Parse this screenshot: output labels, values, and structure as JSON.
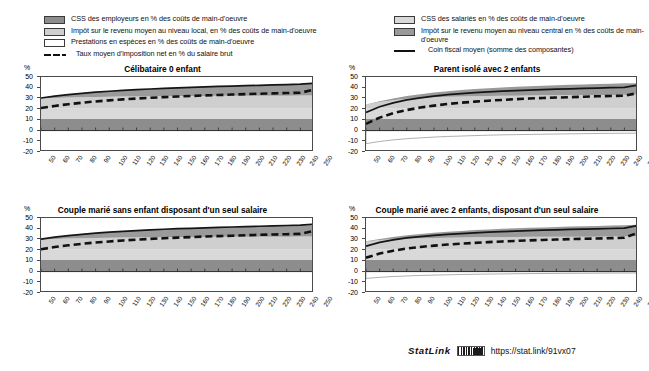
{
  "figure": {
    "units_label": "%",
    "legend_left": [
      {
        "key": "css-employeurs",
        "type": "swatch",
        "color": "#8d8d8d",
        "label": "CSS des employeurs en % des coûts de main-d'oeuvre"
      },
      {
        "key": "impot-local",
        "type": "swatch",
        "color": "#cfcfcf",
        "label": "Impôt sur le revenu moyen au niveau local, en % des coûts de main-d'oeuvre"
      },
      {
        "key": "prestations-especes",
        "type": "swatch",
        "color": "#ffffff",
        "label": "Prestations en espèces en % des coûts de main-d'oeuvre"
      },
      {
        "key": "taux-moyen-imposition-net",
        "type": "dashed",
        "color": "#111111",
        "label": "Taux moyen d'imposition net en % du salaire brut"
      }
    ],
    "legend_right": [
      {
        "key": "css-salaries",
        "type": "swatch",
        "color": "#d9d9d9",
        "label": "CSS des salariés en % des coûts de main-d'oeuvre"
      },
      {
        "key": "impot-central",
        "type": "swatch",
        "color": "#9a9a9a",
        "label": "Impôt sur le revenu moyen au niveau central en %  des coûts de main-d'oeuvre"
      },
      {
        "key": "coin-fiscal-moyen",
        "type": "solid",
        "color": "#111111",
        "label": "Coin fiscal moyen (somme des composantes)"
      }
    ],
    "statlink": {
      "word": "StatLink",
      "icon": "qr-barcode-icon",
      "url": "https://stat.link/91vx07"
    }
  },
  "chart_data": [
    {
      "id": "celibataire-0-enfant",
      "type": "area",
      "title": "Célibataire 0 enfant",
      "xlabel": "",
      "ylabel": "%",
      "ylim": [
        -20,
        50
      ],
      "yticks": [
        50,
        40,
        30,
        20,
        10,
        0,
        -10,
        -20
      ],
      "xlim": [
        50,
        250
      ],
      "x": [
        50,
        60,
        70,
        80,
        90,
        100,
        110,
        120,
        130,
        140,
        150,
        160,
        170,
        180,
        190,
        200,
        210,
        220,
        230,
        240,
        250
      ],
      "grid": false,
      "legend": "shared-top",
      "series": [
        {
          "name": "CSS des employeurs en % des coûts de main-d'oeuvre",
          "values": [
            10.8,
            10.8,
            10.8,
            10.8,
            10.8,
            10.8,
            10.8,
            10.8,
            10.8,
            10.8,
            10.8,
            10.8,
            10.8,
            10.8,
            10.8,
            10.8,
            10.8,
            10.8,
            10.8,
            10.8,
            10.8
          ]
        },
        {
          "name": "CSS des salariés en % des coûts de main-d'oeuvre",
          "values": [
            9.8,
            9.8,
            9.8,
            9.8,
            9.8,
            9.8,
            9.8,
            9.8,
            9.8,
            9.8,
            9.8,
            9.8,
            9.8,
            9.8,
            9.8,
            9.8,
            9.8,
            9.8,
            9.8,
            9.8,
            9.8
          ]
        },
        {
          "name": "Impôt sur le revenu moyen au niveau local, en % des coûts de main-d'oeuvre",
          "values": [
            9.3,
            9.9,
            10.3,
            10.6,
            10.8,
            11.0,
            11.2,
            11.3,
            11.4,
            11.5,
            11.6,
            11.6,
            11.7,
            11.8,
            11.8,
            11.9,
            11.9,
            12.0,
            12.0,
            12.1,
            12.1
          ]
        },
        {
          "name": "Impôt sur le revenu moyen au niveau central en %  des coûts de main-d'oeuvre",
          "values": [
            0.5,
            1.7,
            2.7,
            3.6,
            4.4,
            5.1,
            5.7,
            6.3,
            6.8,
            7.3,
            7.7,
            8.1,
            8.5,
            8.8,
            9.1,
            9.4,
            9.7,
            10.0,
            10.3,
            10.6,
            11.5
          ]
        },
        {
          "name": "Prestations en espèces en % des coûts de main-d'oeuvre",
          "values": [
            0,
            0,
            0,
            0,
            0,
            0,
            0,
            0,
            0,
            0,
            0,
            0,
            0,
            0,
            0,
            0,
            0,
            0,
            0,
            0,
            0
          ]
        },
        {
          "name": "Coin fiscal moyen (somme des composantes)",
          "values": [
            30.4,
            32.2,
            33.6,
            34.8,
            35.8,
            36.7,
            37.5,
            38.2,
            38.8,
            39.4,
            39.9,
            40.3,
            40.8,
            41.2,
            41.5,
            41.9,
            42.2,
            42.6,
            42.9,
            43.3,
            44.2
          ]
        },
        {
          "name": "Taux moyen d'imposition net en % du salaire brut",
          "values": [
            21.0,
            23.0,
            24.6,
            26.0,
            27.2,
            28.2,
            29.1,
            29.9,
            30.6,
            31.2,
            31.8,
            32.3,
            32.8,
            33.2,
            33.6,
            34.0,
            34.4,
            34.7,
            35.0,
            35.3,
            38.2
          ]
        }
      ]
    },
    {
      "id": "parent-isole-2-enfants",
      "type": "area",
      "title": "Parent isolé avec 2 enfants",
      "xlabel": "",
      "ylabel": "%",
      "ylim": [
        -20,
        50
      ],
      "yticks": [
        50,
        40,
        30,
        20,
        10,
        0,
        -10,
        -20
      ],
      "xlim": [
        50,
        250
      ],
      "x": [
        50,
        60,
        70,
        80,
        90,
        100,
        110,
        120,
        130,
        140,
        150,
        160,
        170,
        180,
        190,
        200,
        210,
        220,
        230,
        240,
        250
      ],
      "grid": false,
      "legend": "shared-top",
      "series": [
        {
          "name": "CSS des employeurs en % des coûts de main-d'oeuvre",
          "values": [
            10.8,
            10.8,
            10.8,
            10.8,
            10.8,
            10.8,
            10.8,
            10.8,
            10.8,
            10.8,
            10.8,
            10.8,
            10.8,
            10.8,
            10.8,
            10.8,
            10.8,
            10.8,
            10.8,
            10.8,
            10.8
          ]
        },
        {
          "name": "CSS des salariés en % des coûts de main-d'oeuvre",
          "values": [
            9.8,
            9.8,
            9.8,
            9.8,
            9.8,
            9.8,
            9.8,
            9.8,
            9.8,
            9.8,
            9.8,
            9.8,
            9.8,
            9.8,
            9.8,
            9.8,
            9.8,
            9.8,
            9.8,
            9.8,
            9.8
          ]
        },
        {
          "name": "Impôt sur le revenu moyen au niveau local, en % des coûts de main-d'oeuvre",
          "values": [
            3.6,
            6.1,
            7.8,
            9.0,
            9.8,
            10.4,
            10.9,
            11.2,
            11.5,
            11.7,
            11.9,
            12.0,
            12.2,
            12.3,
            12.4,
            12.5,
            12.6,
            12.6,
            12.7,
            12.8,
            12.8
          ]
        },
        {
          "name": "Impôt sur le revenu moyen au niveau central en %  des coûts de main-d'oeuvre",
          "values": [
            0.2,
            0.7,
            1.6,
            2.6,
            3.6,
            4.5,
            5.3,
            6.0,
            6.7,
            7.2,
            7.7,
            8.2,
            8.6,
            9.0,
            9.3,
            9.6,
            9.9,
            10.2,
            10.5,
            10.7,
            10.9
          ]
        },
        {
          "name": "Prestations en espèces en % des coûts de main-d'oeuvre",
          "values": [
            -12.2,
            -10.2,
            -8.7,
            -7.6,
            -6.8,
            -6.1,
            -5.5,
            -5.1,
            -4.7,
            -4.3,
            -4.0,
            -3.8,
            -3.6,
            -3.4,
            -3.2,
            -3.0,
            -2.9,
            -2.7,
            -2.6,
            -2.5,
            -2.4
          ]
        },
        {
          "name": "Coin fiscal moyen (somme des composantes)",
          "values": [
            17.0,
            22.2,
            25.9,
            28.6,
            30.6,
            32.2,
            33.5,
            34.5,
            35.4,
            36.1,
            36.8,
            37.3,
            37.8,
            38.3,
            38.7,
            39.0,
            39.4,
            39.7,
            40.0,
            40.3,
            42.4
          ]
        },
        {
          "name": "Taux moyen d'imposition net en % du salaire brut",
          "values": [
            6.3,
            12.1,
            16.2,
            19.2,
            21.5,
            23.3,
            24.8,
            26.0,
            27.0,
            27.9,
            28.6,
            29.3,
            29.9,
            30.4,
            30.8,
            31.2,
            31.6,
            32.0,
            32.3,
            32.6,
            35.0
          ]
        }
      ]
    },
    {
      "id": "couple-marie-sans-enfant-un-seul-salaire",
      "type": "area",
      "title": "Couple marié sans enfant disposant d'un seul salaire",
      "xlabel": "",
      "ylabel": "%",
      "ylim": [
        -20,
        50
      ],
      "yticks": [
        50,
        40,
        30,
        20,
        10,
        0,
        -10,
        -20
      ],
      "xlim": [
        50,
        250
      ],
      "x": [
        50,
        60,
        70,
        80,
        90,
        100,
        110,
        120,
        130,
        140,
        150,
        160,
        170,
        180,
        190,
        200,
        210,
        220,
        230,
        240,
        250
      ],
      "grid": false,
      "legend": "shared-top",
      "series": [
        {
          "name": "CSS des employeurs en % des coûts de main-d'oeuvre",
          "values": [
            10.8,
            10.8,
            10.8,
            10.8,
            10.8,
            10.8,
            10.8,
            10.8,
            10.8,
            10.8,
            10.8,
            10.8,
            10.8,
            10.8,
            10.8,
            10.8,
            10.8,
            10.8,
            10.8,
            10.8,
            10.8
          ]
        },
        {
          "name": "CSS des salariés en % des coûts de main-d'oeuvre",
          "values": [
            9.8,
            9.8,
            9.8,
            9.8,
            9.8,
            9.8,
            9.8,
            9.8,
            9.8,
            9.8,
            9.8,
            9.8,
            9.8,
            9.8,
            9.8,
            9.8,
            9.8,
            9.8,
            9.8,
            9.8,
            9.8
          ]
        },
        {
          "name": "Impôt sur le revenu moyen au niveau local, en % des coûts de main-d'oeuvre",
          "values": [
            9.1,
            9.8,
            10.2,
            10.5,
            10.8,
            11.0,
            11.1,
            11.3,
            11.4,
            11.5,
            11.6,
            11.6,
            11.7,
            11.8,
            11.8,
            11.9,
            11.9,
            12.0,
            12.0,
            12.1,
            12.1
          ]
        },
        {
          "name": "Impôt sur le revenu moyen au niveau central en %  des coûts de main-d'oeuvre",
          "values": [
            0.5,
            1.7,
            2.7,
            3.7,
            4.5,
            5.2,
            5.8,
            6.4,
            6.9,
            7.4,
            7.8,
            8.2,
            8.5,
            8.9,
            9.2,
            9.5,
            9.8,
            10.1,
            10.4,
            10.6,
            11.6
          ]
        },
        {
          "name": "Prestations en espèces en % des coûts de main-d'oeuvre",
          "values": [
            0,
            0,
            0,
            0,
            0,
            0,
            0,
            0,
            0,
            0,
            0,
            0,
            0,
            0,
            0,
            0,
            0,
            0,
            0,
            0,
            0
          ]
        },
        {
          "name": "Coin fiscal moyen (somme des composantes)",
          "values": [
            30.2,
            32.1,
            33.5,
            34.8,
            35.9,
            36.8,
            37.5,
            38.3,
            38.9,
            39.5,
            40.0,
            40.4,
            40.8,
            41.3,
            41.6,
            42.0,
            42.3,
            42.7,
            43.0,
            43.3,
            44.3
          ]
        },
        {
          "name": "Taux moyen d'imposition net en % du salaire brut",
          "values": [
            20.8,
            22.9,
            24.5,
            25.9,
            27.1,
            28.1,
            29.0,
            29.8,
            30.5,
            31.1,
            31.7,
            32.2,
            32.7,
            33.1,
            33.5,
            33.9,
            34.3,
            34.6,
            34.9,
            35.2,
            38.1
          ]
        }
      ]
    },
    {
      "id": "couple-marie-2-enfants-un-seul-salaire",
      "type": "area",
      "title": "Couple marié avec 2 enfants, disposant d'un seul salaire",
      "xlabel": "",
      "ylabel": "%",
      "ylim": [
        -20,
        50
      ],
      "yticks": [
        50,
        40,
        30,
        20,
        10,
        0,
        -10,
        -20
      ],
      "xlim": [
        50,
        250
      ],
      "x": [
        50,
        60,
        70,
        80,
        90,
        100,
        110,
        120,
        130,
        140,
        150,
        160,
        170,
        180,
        190,
        200,
        210,
        220,
        230,
        240,
        250
      ],
      "grid": false,
      "legend": "shared-top",
      "series": [
        {
          "name": "CSS des employeurs en % des coûts de main-d'oeuvre",
          "values": [
            10.8,
            10.8,
            10.8,
            10.8,
            10.8,
            10.8,
            10.8,
            10.8,
            10.8,
            10.8,
            10.8,
            10.8,
            10.8,
            10.8,
            10.8,
            10.8,
            10.8,
            10.8,
            10.8,
            10.8,
            10.8
          ]
        },
        {
          "name": "CSS des salariés en % des coûts de main-d'oeuvre",
          "values": [
            9.8,
            9.8,
            9.8,
            9.8,
            9.8,
            9.8,
            9.8,
            9.8,
            9.8,
            9.8,
            9.8,
            9.8,
            9.8,
            9.8,
            9.8,
            9.8,
            9.8,
            9.8,
            9.8,
            9.8,
            9.8
          ]
        },
        {
          "name": "Impôt sur le revenu moyen au niveau local, en % des coûts de main-d'oeuvre",
          "values": [
            7.3,
            8.8,
            9.6,
            10.1,
            10.5,
            10.8,
            11.0,
            11.2,
            11.4,
            11.5,
            11.6,
            11.7,
            11.8,
            11.8,
            11.9,
            11.9,
            12.0,
            12.0,
            12.1,
            12.1,
            12.2
          ]
        },
        {
          "name": "Impôt sur le revenu moyen au niveau central en %  des coûts de main-d'oeuvre",
          "values": [
            0.3,
            1.1,
            2.1,
            3.1,
            4.0,
            4.8,
            5.5,
            6.1,
            6.7,
            7.2,
            7.7,
            8.1,
            8.5,
            8.8,
            9.2,
            9.5,
            9.8,
            10.0,
            10.3,
            10.6,
            11.0
          ]
        },
        {
          "name": "Prestations en espèces en % des coûts de main-d'oeuvre",
          "values": [
            -6.4,
            -5.4,
            -4.6,
            -4.1,
            -3.6,
            -3.3,
            -3.0,
            -2.7,
            -2.5,
            -2.3,
            -2.2,
            -2.0,
            -1.9,
            -1.8,
            -1.7,
            -1.6,
            -1.6,
            -1.5,
            -1.4,
            -1.4,
            -1.3
          ]
        },
        {
          "name": "Coin fiscal moyen (somme des composantes)",
          "values": [
            23.7,
            27.2,
            29.6,
            31.4,
            32.7,
            33.8,
            34.7,
            35.5,
            36.2,
            36.8,
            37.3,
            37.8,
            38.2,
            38.6,
            39.0,
            39.3,
            39.6,
            39.9,
            40.2,
            40.5,
            42.9
          ]
        },
        {
          "name": "Taux moyen d'imposition net en % du salaire brut",
          "values": [
            13.0,
            16.8,
            19.5,
            21.5,
            23.0,
            24.2,
            25.2,
            26.1,
            26.8,
            27.5,
            28.1,
            28.6,
            29.1,
            29.5,
            29.9,
            30.3,
            30.6,
            30.9,
            31.2,
            31.5,
            36.3
          ]
        }
      ]
    }
  ]
}
